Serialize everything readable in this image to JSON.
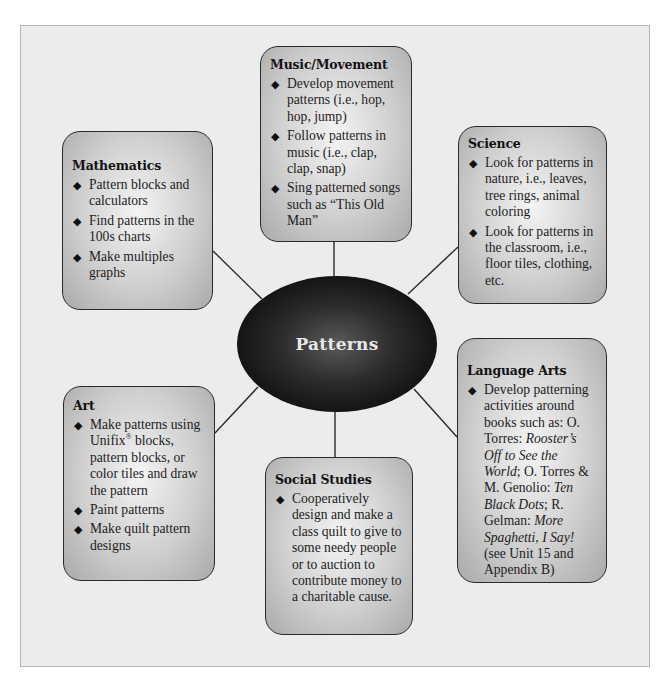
{
  "diagram": {
    "type": "concept-web",
    "center": {
      "label": "Patterns",
      "fill": "#0d0d0d",
      "text_color": "#e8e8e8"
    },
    "colors": {
      "background": "#ececec",
      "box_fill_light": "#f4f4f4",
      "box_fill_dark": "#a9a9a9",
      "border": "#2a2a2a",
      "connector": "#2a2a2a"
    },
    "bullet_icon": "diamond-bullet-icon",
    "bullet_glyph": "◆",
    "nodes": {
      "music": {
        "title": "Music/Movement",
        "items": [
          "Develop movement patterns (i.e., hop, hop, jump)",
          "Follow patterns in music (i.e., clap, clap, snap)",
          "Sing patterned songs such as “This Old Man”"
        ]
      },
      "mathematics": {
        "title": "Mathematics",
        "items": [
          "Pattern blocks and calculators",
          "Find patterns in the 100s charts",
          "Make multiples graphs"
        ]
      },
      "science": {
        "title": "Science",
        "items": [
          "Look for patterns in nature, i.e., leaves, tree rings, animal coloring",
          "Look for patterns in the classroom, i.e., floor tiles, clothing, etc."
        ]
      },
      "language_arts": {
        "title": "Language Arts",
        "items": [
          {
            "parts": {
              "p1": "Develop patterning activities around books such as: O. Torres: ",
              "t1": "Rooster’s Off to See the World",
              "p2": "; O. Torres & M. Genolio: ",
              "t2": "Ten Black Dots",
              "p3": "; R. Gelman: ",
              "t3": "More Spaghetti, I Say!",
              "p4": " (see Unit 15 and Appendix B)"
            }
          }
        ]
      },
      "art": {
        "title": "Art",
        "items": [
          {
            "parts": {
              "p1": "Make patterns using Unifix",
              "sup": "®",
              "p2": " blocks, pattern blocks, or color tiles and draw the pattern"
            }
          },
          "Paint patterns",
          "Make quilt pattern designs"
        ]
      },
      "social_studies": {
        "title": "Social Studies",
        "items": [
          "Cooperatively design and make a class quilt to give to some needy people or to auction to contribute money to a charitable cause."
        ]
      }
    },
    "edges": [
      {
        "from": "Patterns",
        "to": "Music/Movement"
      },
      {
        "from": "Patterns",
        "to": "Mathematics"
      },
      {
        "from": "Patterns",
        "to": "Science"
      },
      {
        "from": "Patterns",
        "to": "Language Arts"
      },
      {
        "from": "Patterns",
        "to": "Art"
      },
      {
        "from": "Patterns",
        "to": "Social Studies"
      }
    ]
  }
}
